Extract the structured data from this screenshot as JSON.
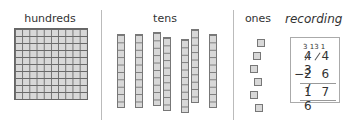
{
  "columns": {
    "hundreds": {
      "label": "hundreds",
      "grid_rows": 10,
      "grid_cols": 10
    },
    "tens": {
      "label": "tens",
      "rod_count": 7,
      "cells_per_rod": 10
    },
    "ones": {
      "label": "ones",
      "count": 6
    }
  },
  "recording": {
    "title": "recording",
    "carries": "3 13 1",
    "minuend": "4 4 3",
    "operator": "−",
    "subtrahend": "2 6 7",
    "result": "1 7 6"
  },
  "colors": {
    "block_fill": "#d8d8d8",
    "block_border": "#777777",
    "divider": "#bbbbbb"
  }
}
